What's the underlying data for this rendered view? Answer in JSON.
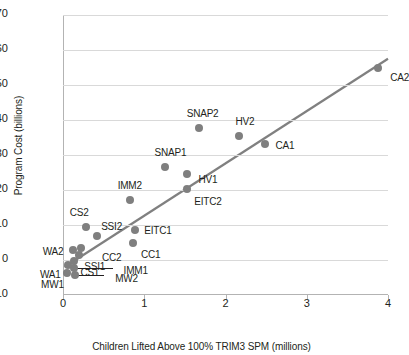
{
  "chart_data": {
    "type": "scatter",
    "title": "",
    "xlabel": "Children Lifted Above 100% TRIM3 SPM (millions)",
    "ylabel": "Program Cost (billions)",
    "xlim": [
      0,
      4
    ],
    "ylim": [
      -10,
      70
    ],
    "xticks": [
      "0",
      "1",
      "2",
      "3",
      "4"
    ],
    "yticks": [
      "70",
      "60",
      "50",
      "40",
      "30",
      "20",
      "10",
      "0",
      "-10"
    ],
    "grid": true,
    "legend": "none",
    "marker_color": "#7f7f7f",
    "trendline_color": "#808080",
    "trendline": {
      "x0": 0.02,
      "y0": -2.0,
      "x1": 4.0,
      "y1": 57.5
    },
    "points": [
      {
        "label": "CA2",
        "x": 3.88,
        "y": 55.0,
        "lx": 12,
        "ly": 10
      },
      {
        "label": "SNAP2",
        "x": 1.67,
        "y": 37.8,
        "lx": -12,
        "ly": -14
      },
      {
        "label": "HV2",
        "x": 2.16,
        "y": 35.3,
        "lx": -3,
        "ly": -14
      },
      {
        "label": "CA1",
        "x": 2.48,
        "y": 33.2,
        "lx": 11,
        "ly": 2
      },
      {
        "label": "SNAP1",
        "x": 1.25,
        "y": 26.7,
        "lx": -10,
        "ly": -14
      },
      {
        "label": "HV1",
        "x": 1.52,
        "y": 24.6,
        "lx": 12,
        "ly": 6
      },
      {
        "label": "EITC2",
        "x": 1.53,
        "y": 20.4,
        "lx": 7,
        "ly": 13
      },
      {
        "label": "IMM2",
        "x": 0.82,
        "y": 17.1,
        "lx": -12,
        "ly": -14
      },
      {
        "label": "CS2",
        "x": 0.28,
        "y": 9.3,
        "lx": -16,
        "ly": -14
      },
      {
        "label": "EITC1",
        "x": 0.89,
        "y": 8.5,
        "lx": 9,
        "ly": 1
      },
      {
        "label": "SSI2",
        "x": 0.42,
        "y": 7.0,
        "lx": 4,
        "ly": -9
      },
      {
        "label": "CC1",
        "x": 0.86,
        "y": 5.0,
        "lx": 8,
        "ly": 12
      },
      {
        "label": "CC2",
        "x": 0.22,
        "y": 3.5,
        "lx": 21,
        "ly": 10
      },
      {
        "label": "WA2",
        "x": 0.12,
        "y": 2.8,
        "lx": -30,
        "ly": 2
      },
      {
        "label": "SSI1",
        "x": 0.2,
        "y": 1.4,
        "lx": 5,
        "ly": 12
      },
      {
        "label": "CS1",
        "x": 0.14,
        "y": -0.4,
        "lx": 6,
        "ly": 12
      },
      {
        "label": "WA1",
        "x": 0.06,
        "y": -1.4,
        "lx": -28,
        "ly": 10
      },
      {
        "label": "IMM1",
        "x": 0.13,
        "y": -2.3,
        "lx": 50,
        "ly": 3
      },
      {
        "label": "MW1",
        "x": 0.05,
        "y": -3.6,
        "lx": -26,
        "ly": 12
      },
      {
        "label": "MW2",
        "x": 0.15,
        "y": -4.4,
        "lx": 40,
        "ly": 4
      }
    ],
    "leaders": [
      {
        "label": "IMM1",
        "x_from": 0.13,
        "y_from": -2.3,
        "x_to": 0.62,
        "y_to": -2.3
      },
      {
        "label": "MW2",
        "x_from": 0.15,
        "y_from": -4.4,
        "x_to": 0.5,
        "y_to": -4.4
      }
    ]
  }
}
